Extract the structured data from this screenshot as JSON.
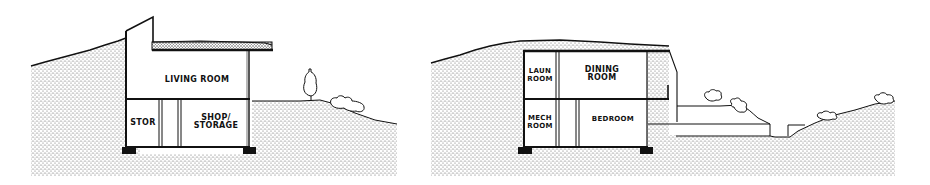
{
  "diagram": {
    "type": "architectural-section",
    "colors": {
      "ink": "#111111",
      "paper": "#ffffff",
      "earth_stipple": "#555555"
    },
    "sections": [
      {
        "id": "left",
        "rooms": [
          {
            "name": "living-room",
            "label": "LIVING ROOM"
          },
          {
            "name": "storage",
            "label": "STOR"
          },
          {
            "name": "shop-storage",
            "label_line1": "SHOP/",
            "label_line2": "STORAGE"
          }
        ],
        "landscape": [
          "tree",
          "shrub",
          "sloped-earth-berm",
          "green-roof"
        ]
      },
      {
        "id": "right",
        "rooms": [
          {
            "name": "laundry-room",
            "label_line1": "LAUN",
            "label_line2": "ROOM"
          },
          {
            "name": "dining-room",
            "label_line1": "DINING",
            "label_line2": "ROOM"
          },
          {
            "name": "mechanical-room",
            "label_line1": "MECH",
            "label_line2": "ROOM"
          },
          {
            "name": "bedroom",
            "label": "BEDROOM"
          }
        ],
        "landscape": [
          "shrubs",
          "terrace-steps",
          "sloped-earth-berm",
          "earth-covered-roof"
        ]
      }
    ]
  }
}
